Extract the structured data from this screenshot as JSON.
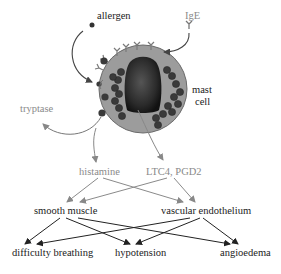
{
  "diagram": {
    "nodes": {
      "allergen": "allergen",
      "ige": "IgE",
      "mast_cell_line1": "mast",
      "mast_cell_line2": "cell",
      "tryptase": "tryptase",
      "histamine": "histamine",
      "ltc4_pgd2": "LTC4, PGD2",
      "smooth_muscle": "smooth muscle",
      "vascular_endothelium": "vascular endothelium",
      "difficulty_breathing": "difficulty breathing",
      "hypotension": "hypotension",
      "angioedema": "angioedema"
    },
    "edges": [
      {
        "from": "allergen",
        "to": "mast cell"
      },
      {
        "from": "IgE",
        "to": "mast cell"
      },
      {
        "from": "mast cell",
        "to": "tryptase"
      },
      {
        "from": "mast cell",
        "to": "histamine"
      },
      {
        "from": "mast cell",
        "to": "LTC4, PGD2"
      },
      {
        "from": "histamine",
        "to": "smooth muscle"
      },
      {
        "from": "histamine",
        "to": "vascular endothelium"
      },
      {
        "from": "LTC4, PGD2",
        "to": "smooth muscle"
      },
      {
        "from": "LTC4, PGD2",
        "to": "vascular endothelium"
      },
      {
        "from": "smooth muscle",
        "to": "difficulty breathing"
      },
      {
        "from": "smooth muscle",
        "to": "hypotension"
      },
      {
        "from": "smooth muscle",
        "to": "angioedema"
      },
      {
        "from": "vascular endothelium",
        "to": "difficulty breathing"
      },
      {
        "from": "vascular endothelium",
        "to": "hypotension"
      },
      {
        "from": "vascular endothelium",
        "to": "angioedema"
      }
    ],
    "colors": {
      "mediator_text": "#8a8a8a",
      "effect_text": "#222222",
      "cell_fill": "#9a9a9a",
      "nucleus": "#2e2e2e",
      "granule": "#3a3a3a"
    }
  }
}
